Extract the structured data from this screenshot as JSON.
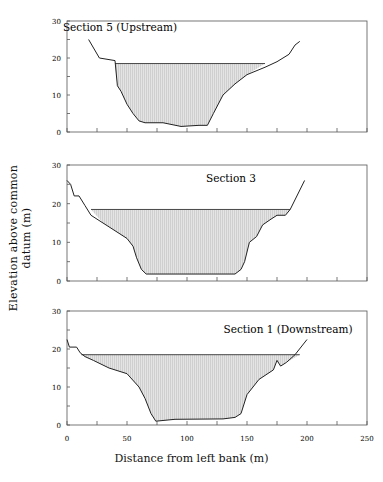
{
  "figure": {
    "ylabel": "Elevation above common datum (m)",
    "xlabel": "Distance from left bank (m)",
    "caption": "Plan of cross-sections ... Upstream to Downstream"
  },
  "chart_data": [
    {
      "type": "area",
      "title": "Section 5 (Upstream)",
      "xlabel": "Distance from left bank (m)",
      "ylabel": "Elevation above common datum (m)",
      "xlim": [
        0,
        250
      ],
      "ylim": [
        0,
        30
      ],
      "xticks": [
        0,
        25,
        50,
        75,
        100,
        125,
        150,
        175,
        200,
        225,
        250
      ],
      "yticks": [
        0,
        5,
        10,
        15,
        20,
        25,
        30
      ],
      "ytick_labels": [
        "0",
        "10",
        "20",
        "30"
      ],
      "water_level": 18.5,
      "water_extent": [
        40,
        165
      ],
      "bed_profile": [
        [
          18,
          25
        ],
        [
          27,
          20
        ],
        [
          40,
          19.3
        ],
        [
          42,
          12.5
        ],
        [
          45,
          11
        ],
        [
          50,
          7.5
        ],
        [
          55,
          5
        ],
        [
          60,
          3
        ],
        [
          65,
          2.5
        ],
        [
          80,
          2.5
        ],
        [
          95,
          1.5
        ],
        [
          110,
          1.8
        ],
        [
          117,
          1.8
        ],
        [
          122,
          5
        ],
        [
          130,
          10
        ],
        [
          140,
          13
        ],
        [
          150,
          15.5
        ],
        [
          165,
          17.5
        ],
        [
          175,
          19
        ],
        [
          185,
          21
        ],
        [
          190,
          23.5
        ],
        [
          194,
          24.5
        ]
      ]
    },
    {
      "type": "area",
      "title": "Section 3",
      "xlabel": "Distance from left bank (m)",
      "ylabel": "Elevation above common datum (m)",
      "xlim": [
        0,
        250
      ],
      "ylim": [
        0,
        30
      ],
      "xticks": [
        0,
        25,
        50,
        75,
        100,
        125,
        150,
        175,
        200,
        225,
        250
      ],
      "yticks": [
        0,
        5,
        10,
        15,
        20,
        25,
        30
      ],
      "ytick_labels": [
        "0",
        "10",
        "20",
        "30"
      ],
      "water_level": 18.5,
      "water_extent": [
        20,
        186
      ],
      "bed_profile": [
        [
          0,
          26
        ],
        [
          3,
          25
        ],
        [
          6,
          22
        ],
        [
          10,
          22
        ],
        [
          15,
          19.5
        ],
        [
          20,
          17
        ],
        [
          30,
          15
        ],
        [
          40,
          13
        ],
        [
          50,
          11
        ],
        [
          55,
          9
        ],
        [
          58,
          6
        ],
        [
          62,
          3
        ],
        [
          66,
          1.8
        ],
        [
          140,
          1.8
        ],
        [
          145,
          3
        ],
        [
          148,
          5
        ],
        [
          152,
          10
        ],
        [
          158,
          11.5
        ],
        [
          163,
          14.5
        ],
        [
          170,
          16
        ],
        [
          175,
          17
        ],
        [
          182,
          17
        ],
        [
          186,
          18.5
        ],
        [
          198,
          26
        ]
      ]
    },
    {
      "type": "area",
      "title": "Section 1 (Downstream)",
      "xlabel": "Distance from left bank (m)",
      "ylabel": "Elevation above common datum (m)",
      "xlim": [
        0,
        250
      ],
      "ylim": [
        0,
        30
      ],
      "xticks": [
        0,
        25,
        50,
        75,
        100,
        125,
        150,
        175,
        200,
        225,
        250
      ],
      "xtick_labels": [
        "0",
        "50",
        "100",
        "150",
        "200",
        "250"
      ],
      "yticks": [
        0,
        5,
        10,
        15,
        20,
        25,
        30
      ],
      "ytick_labels": [
        "0",
        "10",
        "20",
        "30"
      ],
      "water_level": 18.5,
      "water_extent": [
        12,
        194
      ],
      "bed_profile": [
        [
          0,
          22.5
        ],
        [
          2,
          20.5
        ],
        [
          8,
          20.5
        ],
        [
          11,
          19
        ],
        [
          15,
          18
        ],
        [
          22,
          17
        ],
        [
          35,
          15
        ],
        [
          50,
          13.5
        ],
        [
          60,
          10
        ],
        [
          65,
          7
        ],
        [
          70,
          3
        ],
        [
          74,
          1
        ],
        [
          90,
          1.5
        ],
        [
          130,
          1.6
        ],
        [
          140,
          2
        ],
        [
          145,
          3
        ],
        [
          150,
          8
        ],
        [
          160,
          12
        ],
        [
          172,
          14.5
        ],
        [
          175,
          17
        ],
        [
          178,
          15.5
        ],
        [
          183,
          16.5
        ],
        [
          190,
          18.5
        ],
        [
          200,
          22.5
        ]
      ]
    }
  ]
}
